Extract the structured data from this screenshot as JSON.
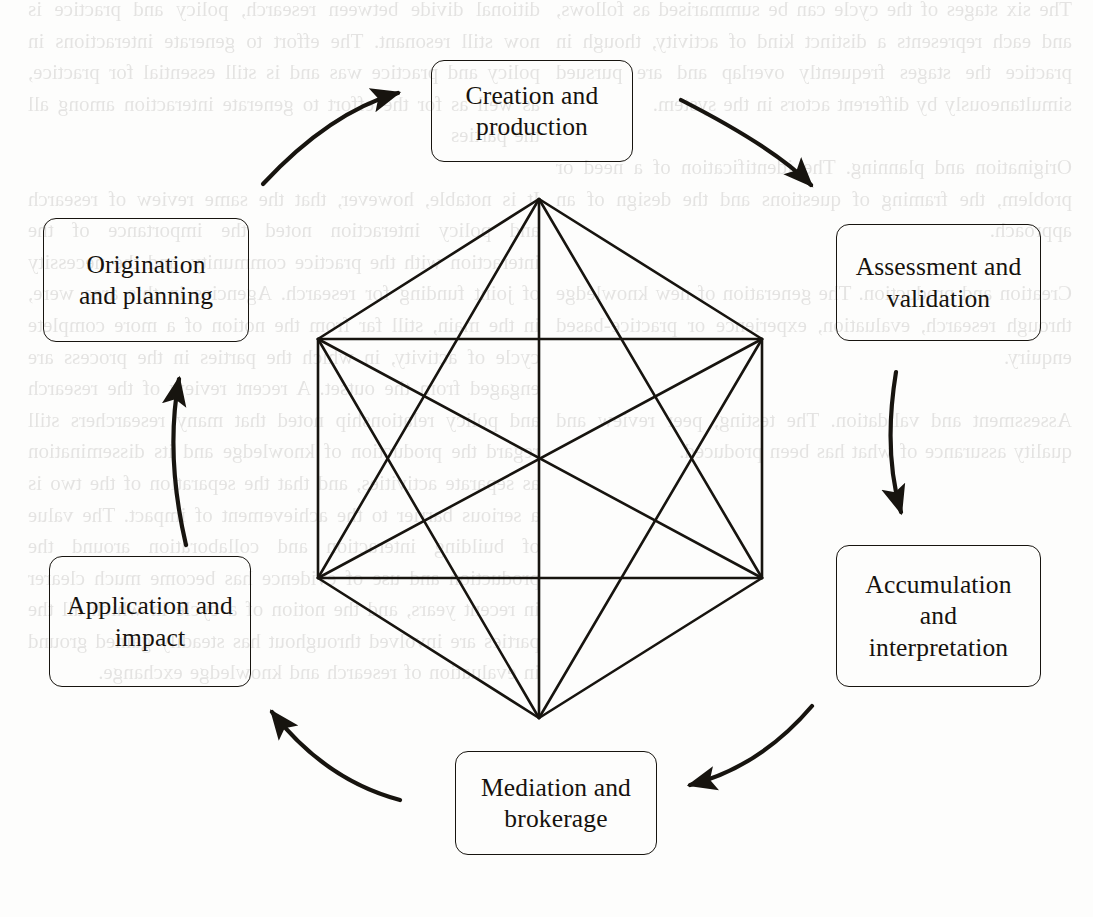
{
  "diagram": {
    "type": "cycle-diagram",
    "flow_direction": "clockwise",
    "stroke_color": "#17140f",
    "background_color": "#fdfdfc",
    "nodes": [
      {
        "id": "creation",
        "label": "Creation and\nproduction",
        "position": "top"
      },
      {
        "id": "assessment",
        "label": "Assessment and\nvalidation",
        "position": "top-right"
      },
      {
        "id": "accumulation",
        "label": "Accumulation\nand\ninterpretation",
        "position": "bottom-right"
      },
      {
        "id": "mediation",
        "label": "Mediation and\nbrokerage",
        "position": "bottom"
      },
      {
        "id": "application",
        "label": "Application and\nimpact",
        "position": "bottom-left"
      },
      {
        "id": "origination",
        "label": "Origination\nand planning",
        "position": "top-left"
      }
    ],
    "arrows": [
      {
        "from": "creation",
        "to": "assessment"
      },
      {
        "from": "assessment",
        "to": "accumulation"
      },
      {
        "from": "accumulation",
        "to": "mediation"
      },
      {
        "from": "mediation",
        "to": "application"
      },
      {
        "from": "application",
        "to": "origination"
      },
      {
        "from": "origination",
        "to": "creation"
      }
    ],
    "inner_graph": {
      "shape": "hexagon",
      "description": "Regular hexagon with all 15 edges of the complete graph K6 drawn between its six vertices",
      "vertex_count": 6,
      "edge_count": 15
    }
  },
  "bleed_text": {
    "left_column": "ditional divide between research, policy and practice is now still resonant. The effort to generate interactions in policy and practice was and is still essential for practice, as well as for the effort to generate interaction among all the parties\n\nIt is notable, however, that the same review of research and policy interaction noted the importance of the interaction with the practice community, and the necessity of joint funding for research. Agencies in this area were, in the main, still far from the notion of a more complete cycle of activity, in which the parties in the process are engaged from the outset. A recent review of the research and policy relationship noted that many researchers still regard the production of knowledge and its dissemination as separate activities, and that the separation of the two is a serious barrier to the achievement of impact. The value of building interaction and collaboration around the production and use of evidence has become much clearer in recent years, and the notion of a cycle in which all the parties are involved throughout has steadily gained ground in evaluation of research and knowledge exchange.",
    "right_column": "The six stages of the cycle can be summarised as follows, and each represents a distinct kind of activity, though in practice the stages frequently overlap and are pursued simultaneously by different actors in the system.\n\nOrigination and planning. The identification of a need or problem, the framing of questions and the design of an approach.\n\nCreation and production. The generation of new knowledge through research, evaluation, experience or practice-based enquiry.\n\nAssessment and validation. The testing, peer review and quality assurance of what has been produced."
  }
}
